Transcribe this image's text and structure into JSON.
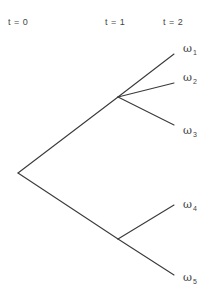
{
  "diagram": {
    "type": "event-tree",
    "time_labels": [
      {
        "label": "t = 0",
        "x": 8
      },
      {
        "label": "t = 1",
        "x": 105
      },
      {
        "label": "t = 2",
        "x": 163
      }
    ],
    "nodes": {
      "root": {
        "x": 18,
        "y": 173
      },
      "n1_upper": {
        "x": 118,
        "y": 97
      },
      "n1_lower": {
        "x": 118,
        "y": 239
      }
    },
    "leaves": [
      {
        "symbol": "ω",
        "index": "1",
        "x": 174,
        "y": 54,
        "parent": "n1_upper"
      },
      {
        "symbol": "ω",
        "index": "2",
        "x": 174,
        "y": 83,
        "parent": "n1_upper"
      },
      {
        "symbol": "ω",
        "index": "3",
        "x": 174,
        "y": 125,
        "parent": "n1_upper"
      },
      {
        "symbol": "ω",
        "index": "4",
        "x": 174,
        "y": 205,
        "parent": "n1_lower"
      },
      {
        "symbol": "ω",
        "index": "5",
        "x": 174,
        "y": 275,
        "parent": "n1_lower"
      }
    ],
    "line_color": "#3a3a3a"
  }
}
